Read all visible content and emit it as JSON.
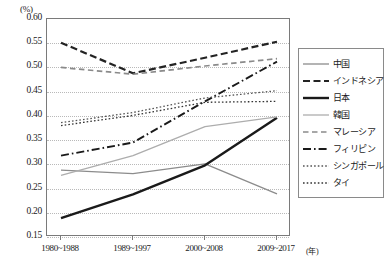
{
  "chart_data": {
    "type": "line",
    "title": "",
    "xlabel": "年",
    "ylabel": "(%)",
    "ylim": [
      0.15,
      0.6
    ],
    "ytick_labels": [
      "0.60",
      "0.55",
      "0.50",
      "0.45",
      "0.40",
      "0.35",
      "0.30",
      "0.25",
      "0.20",
      "0.15"
    ],
    "ytick_values": [
      0.6,
      0.55,
      0.5,
      0.45,
      0.4,
      0.35,
      0.3,
      0.25,
      0.2,
      0.15
    ],
    "grid": true,
    "legend_position": "right",
    "categories": [
      "1980~1988",
      "1989~1997",
      "2000~2008",
      "2009~2017"
    ],
    "series": [
      {
        "name": "中国",
        "style": "solid",
        "color": "#8c8c8c",
        "width": 1.3,
        "values": [
          0.288,
          0.281,
          0.301,
          0.239
        ]
      },
      {
        "name": "インドネシア",
        "style": "dashed-heavy",
        "color": "#232323",
        "width": 2.2,
        "values": [
          0.551,
          0.488,
          0.52,
          0.553
        ]
      },
      {
        "name": "日本",
        "style": "solid",
        "color": "#1a1a1a",
        "width": 2.4,
        "values": [
          0.189,
          0.238,
          0.298,
          0.396
        ]
      },
      {
        "name": "韓国",
        "style": "solid",
        "color": "#adadad",
        "width": 1.3,
        "values": [
          0.277,
          0.318,
          0.378,
          0.398
        ]
      },
      {
        "name": "マレーシア",
        "style": "dashed-medium",
        "color": "#8a8a8a",
        "width": 1.7,
        "values": [
          0.5,
          0.486,
          0.503,
          0.518
        ]
      },
      {
        "name": "フィリピン",
        "style": "dash-dot",
        "color": "#1a1a1a",
        "width": 1.9,
        "values": [
          0.318,
          0.345,
          0.43,
          0.512
        ]
      },
      {
        "name": "シンガポール",
        "style": "dotted",
        "color": "#555555",
        "width": 1.3,
        "values": [
          0.386,
          0.407,
          0.437,
          0.452
        ]
      },
      {
        "name": "タイ",
        "style": "dotted",
        "color": "#333333",
        "width": 1.3,
        "values": [
          0.38,
          0.401,
          0.428,
          0.43
        ]
      }
    ]
  },
  "legend": {
    "items": [
      {
        "label": "中国"
      },
      {
        "label": "インドネシア"
      },
      {
        "label": "日本"
      },
      {
        "label": "韓国"
      },
      {
        "label": "マレーシア"
      },
      {
        "label": "フィリピン"
      },
      {
        "label": "シンガポール"
      },
      {
        "label": "タイ"
      }
    ]
  },
  "axis": {
    "y_unit": "(%)",
    "x_unit": "(年)"
  }
}
